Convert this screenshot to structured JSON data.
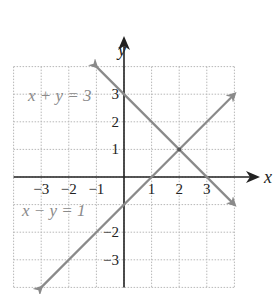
{
  "chart_data": {
    "type": "line",
    "title": "",
    "xlabel": "x",
    "ylabel": "y",
    "xlim": [
      -4,
      4
    ],
    "ylim": [
      -4,
      4
    ],
    "grid": true,
    "x_ticks": [
      -3,
      -2,
      -1,
      1,
      2,
      3
    ],
    "y_ticks": [
      3,
      2,
      1,
      -2,
      -3
    ],
    "x_tick_labels": [
      "−3",
      "−2",
      "−1",
      "1",
      "2",
      "3"
    ],
    "y_tick_labels": [
      "3",
      "2",
      "1",
      "−2",
      "−3"
    ],
    "series": [
      {
        "name": "x + y = 3",
        "label": "x + y = 3",
        "equation": "y = 3 - x",
        "x": [
          -1,
          4
        ],
        "y": [
          4,
          -1
        ],
        "color": "#8a8a8a"
      },
      {
        "name": "x − y = 1",
        "label": "x − y = 1",
        "equation": "y = x - 1",
        "x": [
          -3,
          4
        ],
        "y": [
          -4,
          3
        ],
        "color": "#8a8a8a"
      }
    ],
    "annotations": [
      {
        "type": "point",
        "x": 2,
        "y": 1,
        "note": "intersection"
      }
    ],
    "colors": {
      "lines": "#8a8a8a",
      "axes": "#222222",
      "grid": "#b8b8b8"
    }
  },
  "labels": {
    "x_axis": "x",
    "y_axis": "y",
    "eq1": "x + y = 3",
    "eq2": "x − y = 1"
  }
}
